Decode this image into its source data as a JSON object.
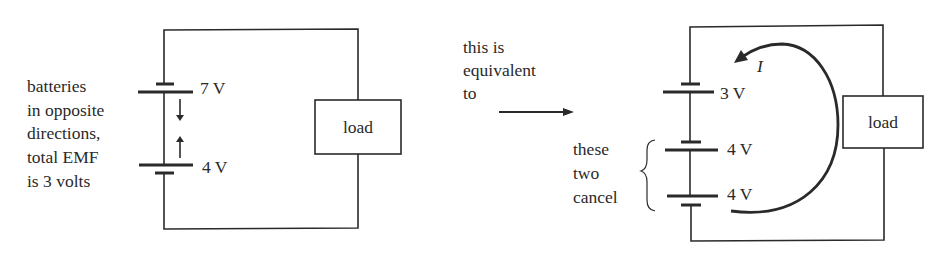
{
  "left_circuit": {
    "annotation": [
      "batteries",
      "in opposite",
      "directions,",
      "total EMF",
      "is 3 volts"
    ],
    "battery_top_label": "7 V",
    "battery_bottom_label": "4 V",
    "load_label": "load"
  },
  "middle": {
    "annotation": [
      "this is",
      "equivalent",
      "to"
    ]
  },
  "right_circuit": {
    "battery_1_label": "3 V",
    "battery_2_label": "4 V",
    "battery_3_label": "4 V",
    "cancel_annotation": [
      "these",
      "two",
      "cancel"
    ],
    "current_label": "I",
    "load_label": "load"
  },
  "colors": {
    "ink": "#2a2a2a",
    "background": "#ffffff"
  }
}
